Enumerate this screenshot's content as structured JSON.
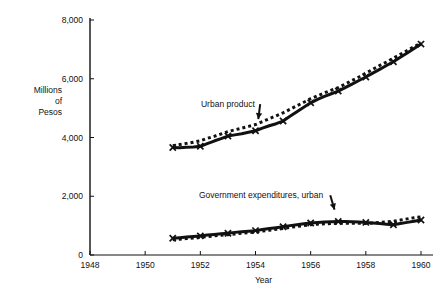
{
  "chart_data": {
    "type": "line",
    "title": "",
    "xlabel": "Year",
    "ylabel": "Millions of Pesos",
    "ylabel_lines": [
      "Millions",
      "of",
      "Pesos"
    ],
    "xlim": [
      1948,
      1960
    ],
    "ylim": [
      0,
      8000
    ],
    "grid": false,
    "legend_position": "inline-annotations",
    "x_ticks": [
      1948,
      1950,
      1952,
      1954,
      1956,
      1958,
      1960
    ],
    "x_tick_labels": [
      "1948",
      "1950",
      "1952",
      "1954",
      "1956",
      "1958",
      "1960"
    ],
    "y_ticks": [
      0,
      2000,
      4000,
      6000,
      8000
    ],
    "y_tick_labels": [
      "0",
      "2,000",
      "4,000",
      "6,000",
      "8,000"
    ],
    "annotations": [
      {
        "text": "Urban product",
        "x": 1953.0,
        "y": 5050,
        "arrow_to_x": 1954.1,
        "arrow_to_y": 4620
      },
      {
        "text": "Government expenditures, urban",
        "x": 1954.2,
        "y": 1950,
        "arrow_to_x": 1956.9,
        "arrow_to_y": 1430
      }
    ],
    "series": [
      {
        "name": "Urban product",
        "style": "solid-with-x-markers",
        "marker": "x",
        "x": [
          1951.0,
          1951.25,
          1951.5,
          1951.75,
          1952.0,
          1952.25,
          1952.5,
          1952.75,
          1953.0,
          1953.25,
          1953.5,
          1953.75,
          1954.0,
          1954.25,
          1954.5,
          1954.75,
          1955.0,
          1955.25,
          1955.5,
          1955.75,
          1956.0,
          1956.25,
          1956.5,
          1956.75,
          1957.0,
          1957.25,
          1957.5,
          1957.75,
          1958.0,
          1958.25,
          1958.5,
          1958.75,
          1959.0,
          1959.25,
          1959.5,
          1959.75,
          1960.0
        ],
        "values": [
          3660,
          3650,
          3670,
          3680,
          3700,
          3790,
          3880,
          3960,
          4050,
          4090,
          4130,
          4180,
          4230,
          4320,
          4400,
          4470,
          4560,
          4720,
          4880,
          5030,
          5180,
          5300,
          5400,
          5490,
          5580,
          5700,
          5820,
          5940,
          6060,
          6190,
          6320,
          6450,
          6580,
          6730,
          6880,
          7030,
          7180
        ],
        "annual_x": [
          1951,
          1952,
          1953,
          1954,
          1955,
          1956,
          1957,
          1958,
          1959,
          1960
        ],
        "annual_values": [
          3660,
          3700,
          4050,
          4230,
          4560,
          5180,
          5580,
          6060,
          6580,
          7180
        ]
      },
      {
        "name": "Urban product (dotted trend)",
        "style": "dotted",
        "marker": "none",
        "x": [
          1951.0,
          1951.25,
          1951.5,
          1951.75,
          1952.0,
          1952.25,
          1952.5,
          1952.75,
          1953.0,
          1953.25,
          1953.5,
          1953.75,
          1954.0,
          1954.25,
          1954.5,
          1954.75,
          1955.0,
          1955.25,
          1955.5,
          1955.75,
          1956.0,
          1956.25,
          1956.5,
          1956.75,
          1957.0,
          1957.25,
          1957.5,
          1957.75,
          1958.0,
          1958.25,
          1958.5,
          1958.75,
          1959.0,
          1959.25,
          1959.5,
          1959.75,
          1960.0
        ],
        "values": [
          3720,
          3760,
          3800,
          3840,
          3890,
          3970,
          4040,
          4120,
          4200,
          4260,
          4320,
          4380,
          4440,
          4540,
          4640,
          4740,
          4840,
          4960,
          5080,
          5200,
          5320,
          5420,
          5520,
          5610,
          5700,
          5820,
          5940,
          6060,
          6190,
          6320,
          6450,
          6570,
          6700,
          6830,
          6960,
          7090,
          7220
        ]
      },
      {
        "name": "Government expenditures, urban",
        "style": "solid-with-x-markers",
        "marker": "x",
        "x": [
          1951.0,
          1951.25,
          1951.5,
          1951.75,
          1952.0,
          1952.25,
          1952.5,
          1952.75,
          1953.0,
          1953.25,
          1953.5,
          1953.75,
          1954.0,
          1954.25,
          1954.5,
          1954.75,
          1955.0,
          1955.25,
          1955.5,
          1955.75,
          1956.0,
          1956.25,
          1956.5,
          1956.75,
          1957.0,
          1957.25,
          1957.5,
          1957.75,
          1958.0,
          1958.25,
          1958.5,
          1958.75,
          1959.0,
          1959.25,
          1959.5,
          1959.75,
          1960.0
        ],
        "values": [
          570,
          590,
          610,
          630,
          650,
          680,
          700,
          720,
          740,
          770,
          790,
          810,
          830,
          870,
          900,
          930,
          960,
          1000,
          1030,
          1060,
          1090,
          1110,
          1120,
          1130,
          1140,
          1140,
          1130,
          1120,
          1110,
          1090,
          1070,
          1050,
          1030,
          1070,
          1110,
          1150,
          1190
        ],
        "annual_x": [
          1951,
          1952,
          1953,
          1954,
          1955,
          1956,
          1957,
          1958,
          1959,
          1960
        ],
        "annual_values": [
          570,
          650,
          740,
          830,
          960,
          1090,
          1140,
          1110,
          1030,
          1190
        ]
      },
      {
        "name": "Government expenditures, urban (dotted trend)",
        "style": "dotted",
        "marker": "none",
        "x": [
          1951.0,
          1951.25,
          1951.5,
          1951.75,
          1952.0,
          1952.25,
          1952.5,
          1952.75,
          1953.0,
          1953.25,
          1953.5,
          1953.75,
          1954.0,
          1954.25,
          1954.5,
          1954.75,
          1955.0,
          1955.25,
          1955.5,
          1955.75,
          1956.0,
          1956.25,
          1956.5,
          1956.75,
          1957.0,
          1957.25,
          1957.5,
          1957.75,
          1958.0,
          1958.25,
          1958.5,
          1958.75,
          1959.0,
          1959.25,
          1959.5,
          1959.75,
          1960.0
        ],
        "values": [
          520,
          540,
          560,
          580,
          600,
          625,
          650,
          670,
          690,
          715,
          740,
          760,
          780,
          815,
          845,
          875,
          905,
          940,
          970,
          1000,
          1030,
          1050,
          1060,
          1070,
          1080,
          1085,
          1085,
          1080,
          1075,
          1090,
          1110,
          1130,
          1150,
          1190,
          1230,
          1270,
          1300
        ]
      }
    ],
    "colors": {
      "ink": "#111111",
      "background": "#ffffff"
    }
  },
  "axes": {
    "x_axis_label": "Year",
    "y_axis_label_lines": [
      "Millions",
      "of",
      "Pesos"
    ]
  }
}
